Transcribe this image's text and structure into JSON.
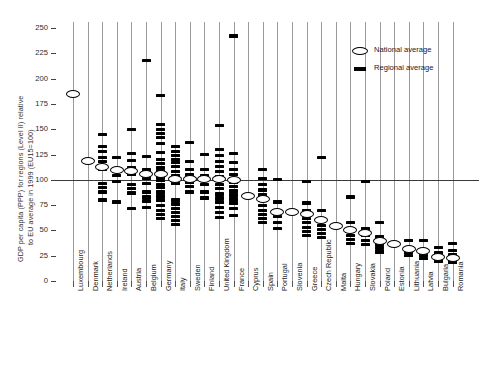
{
  "chart_data": {
    "type": "scatter",
    "title": "",
    "xlabel": "",
    "ylabel": "GDP per capita (PPP) for regions (Level II) relative to EU average in 1999 (EU15=100)",
    "ylabel_line1": "GDP per capita (PPP) for regions (Level II) relative",
    "ylabel_line2": "to EU average in 1999 (EU15=100)",
    "ylim": [
      0,
      255
    ],
    "yticks": [
      0,
      25,
      50,
      75,
      100,
      125,
      150,
      175,
      200,
      225,
      250
    ],
    "ytick_labels": [
      "0",
      "25",
      "50",
      "75",
      "100",
      "125",
      "150",
      "175",
      "200",
      "225",
      "250"
    ],
    "reference_line": 100,
    "grid": "vertical-per-category",
    "legend_position": "top-right",
    "legend": [
      {
        "key": "national",
        "label": "National average",
        "marker": "open-ellipse"
      },
      {
        "key": "regional",
        "label": "Regional average",
        "marker": "filled-dash"
      }
    ],
    "categories": [
      "Luxembourg",
      "Denmark",
      "Netherlands",
      "Ireland",
      "Austria",
      "Belgium",
      "Germany",
      "Italy",
      "Sweden",
      "Finland",
      "United Kingdom",
      "France",
      "Cyprus",
      "Spain",
      "Portugal",
      "Slovenia",
      "Greece",
      "Czech Republic",
      "Malta",
      "Hungary",
      "Slovakia",
      "Poland",
      "Estonia",
      "Lithuania",
      "Latvia",
      "Bulgaria",
      "Romania"
    ],
    "series": [
      {
        "name": "National average",
        "marker": "open-ellipse",
        "values": [
          185,
          119,
          113,
          110,
          109,
          106,
          106,
          101,
          101,
          101,
          101,
          100,
          84,
          81,
          68,
          68,
          66,
          60,
          54,
          50,
          47,
          40,
          37,
          32,
          30,
          24,
          23
        ]
      },
      {
        "name": "Regional average",
        "marker": "filled-dash",
        "points": [
          {
            "category": "Luxembourg",
            "values": [
              185
            ]
          },
          {
            "category": "Denmark",
            "values": [
              119
            ]
          },
          {
            "category": "Netherlands",
            "values": [
              145,
              133,
              128,
              122,
              118,
              113,
              110,
              96,
              92,
              88,
              80
            ]
          },
          {
            "category": "Ireland",
            "values": [
              122,
              104,
              98,
              78
            ]
          },
          {
            "category": "Austria",
            "values": [
              150,
              126,
              119,
              112,
              109,
              105,
              95,
              91,
              87,
              72
            ]
          },
          {
            "category": "Belgium",
            "values": [
              218,
              123,
              110,
              105,
              101,
              96,
              88,
              83,
              79,
              73
            ]
          },
          {
            "category": "Germany",
            "values": [
              183,
              155,
              150,
              146,
              142,
              136,
              127,
              120,
              116,
              112,
              109,
              106,
              102,
              99,
              95,
              92,
              88,
              84,
              80,
              75,
              70,
              66,
              62
            ]
          },
          {
            "category": "Italy",
            "values": [
              133,
              128,
              124,
              120,
              117,
              113,
              108,
              104,
              100,
              96,
              80,
              76,
              72,
              68,
              64,
              60,
              56
            ]
          },
          {
            "category": "Sweden",
            "values": [
              137,
              118,
              110,
              105,
              101,
              97,
              93,
              88
            ]
          },
          {
            "category": "Finland",
            "values": [
              125,
              110,
              104,
              100,
              95,
              88,
              82
            ]
          },
          {
            "category": "United Kingdom",
            "values": [
              154,
              130,
              124,
              118,
              113,
              108,
              103,
              99,
              95,
              91,
              86,
              82,
              78,
              73,
              68,
              63
            ]
          },
          {
            "category": "France",
            "values": [
              242,
              126,
              117,
              110,
              105,
              101,
              97,
              93,
              89,
              85,
              81,
              77,
              72,
              65
            ]
          },
          {
            "category": "Cyprus",
            "values": [
              84
            ]
          },
          {
            "category": "Spain",
            "values": [
              110,
              101,
              95,
              90,
              85,
              80,
              75,
              70,
              66,
              62,
              58
            ]
          },
          {
            "category": "Portugal",
            "values": [
              100,
              78,
              70,
              64,
              58,
              52
            ]
          },
          {
            "category": "Slovenia",
            "values": [
              68
            ]
          },
          {
            "category": "Greece",
            "values": [
              98,
              77,
              70,
              66,
              62,
              58,
              53,
              49,
              45
            ]
          },
          {
            "category": "Czech Republic",
            "values": [
              122,
              70,
              60,
              55,
              51,
              47,
              43
            ]
          },
          {
            "category": "Malta",
            "values": [
              54
            ]
          },
          {
            "category": "Hungary",
            "values": [
              83,
              58,
              50,
              45,
              41,
              37
            ]
          },
          {
            "category": "Slovakia",
            "values": [
              98,
              52,
              45,
              40,
              36
            ]
          },
          {
            "category": "Poland",
            "values": [
              58,
              44,
              40,
              36,
              33,
              30,
              28
            ]
          },
          {
            "category": "Estonia",
            "values": [
              37
            ]
          },
          {
            "category": "Lithuania",
            "values": [
              40,
              32,
              28,
              25
            ]
          },
          {
            "category": "Latvia",
            "values": [
              40,
              30,
              25,
              22
            ]
          },
          {
            "category": "Bulgaria",
            "values": [
              33,
              28,
              24,
              21,
              19
            ]
          },
          {
            "category": "Romania",
            "values": [
              37,
              30,
              26,
              23,
              20,
              18
            ]
          }
        ]
      }
    ]
  }
}
